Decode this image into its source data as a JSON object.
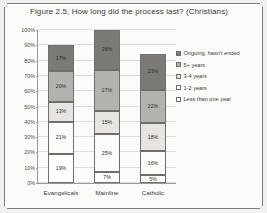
{
  "figure": {
    "title": "Figure 2.5, How long did the process last? (Christians)"
  },
  "chart_data": {
    "type": "bar",
    "subtype": "stacked-bar-100-percent",
    "title": "Figure 2.5, How long did the process last? (Christians)",
    "xlabel": "",
    "ylabel": "",
    "ylim": [
      0,
      100
    ],
    "ytick_labels": [
      "0%",
      "10%",
      "20%",
      "30%",
      "40%",
      "50%",
      "60%",
      "70%",
      "80%",
      "90%",
      "100%"
    ],
    "ytick_values": [
      0,
      10,
      20,
      30,
      40,
      50,
      60,
      70,
      80,
      90,
      100
    ],
    "grid": true,
    "legend_position": "right",
    "categories": [
      "Evangelicals",
      "Mainline",
      "Catholic"
    ],
    "series": [
      {
        "name": "Less than one year",
        "color": "#ffffff",
        "values": [
          19,
          7,
          5
        ],
        "labels": [
          "19%",
          "7%",
          "5%"
        ]
      },
      {
        "name": "1-2 years",
        "color": "#fbfbf9",
        "values": [
          21,
          25,
          16
        ],
        "labels": [
          "21%",
          "25%",
          "16%"
        ]
      },
      {
        "name": "3-4 years",
        "color": "#e6e5e1",
        "values": [
          13,
          15,
          18
        ],
        "labels": [
          "13%",
          "15%",
          "18%"
        ]
      },
      {
        "name": "5+ years",
        "color": "#b3b2ae",
        "values": [
          20,
          27,
          22
        ],
        "labels": [
          "20%",
          "27%",
          "22%"
        ]
      },
      {
        "name": "Ongoing, hasn't ended",
        "color": "#7b7a76",
        "values": [
          17,
          26,
          23
        ],
        "labels": [
          "17%",
          "26%",
          "23%"
        ]
      }
    ]
  },
  "legend": {
    "items": [
      {
        "label": "Ongoing, hasn't ended",
        "color": "#7b7a76"
      },
      {
        "label": "5+ years",
        "color": "#b3b2ae"
      },
      {
        "label": "3-4 years",
        "color": "#e6e5e1"
      },
      {
        "label": "1-2 years",
        "color": "#fbfbf9"
      },
      {
        "label": "Less than one year",
        "color": "#ffffff"
      }
    ]
  }
}
